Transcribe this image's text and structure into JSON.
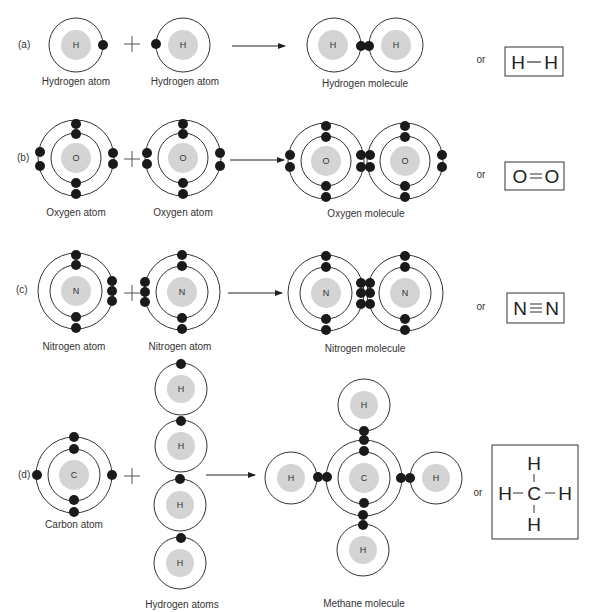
{
  "rows": [
    {
      "id": "a",
      "tag": "(a)",
      "reactant1_label": "Hydrogen atom",
      "reactant2_label": "Hydrogen atom",
      "product_label": "Hydrogen molecule",
      "or": "or",
      "formula": [
        "H",
        "H"
      ],
      "bond": "single",
      "nucleus": "H"
    },
    {
      "id": "b",
      "tag": "(b)",
      "reactant1_label": "Oxygen atom",
      "reactant2_label": "Oxygen atom",
      "product_label": "Oxygen molecule",
      "or": "or",
      "formula": [
        "O",
        "O"
      ],
      "bond": "double",
      "nucleus": "O"
    },
    {
      "id": "c",
      "tag": "(c)",
      "reactant1_label": "Nitrogen atom",
      "reactant2_label": "Nitrogen atom",
      "product_label": "Nitrogen molecule",
      "or": "or",
      "formula": [
        "N",
        "N"
      ],
      "bond": "triple",
      "nucleus": "N"
    },
    {
      "id": "d",
      "tag": "(d)",
      "reactant1_label": "Carbon atom",
      "reactant2_label": "Hydrogen atoms",
      "product_label": "Methane molecule",
      "or": "or",
      "formula": {
        "center": "C",
        "top": "H",
        "bottom": "H",
        "left": "H",
        "right": "H"
      },
      "nucleus_center": "C",
      "nucleus_h": "H"
    }
  ],
  "symbols": {
    "plus": "+",
    "arrow": "reaction-arrow"
  },
  "colors": {
    "nucleus": "#d4d4d4",
    "electron": "#1a1a1a",
    "shell": "#333333"
  }
}
